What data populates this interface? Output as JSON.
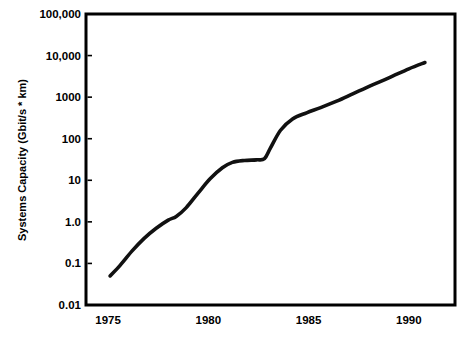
{
  "chart_data": {
    "type": "line",
    "title": "",
    "xlabel": "",
    "ylabel": "Systems Capacity (Gbit/s * km)",
    "xlim": [
      1973.9,
      1992.3
    ],
    "ylim": [
      0.01,
      100000
    ],
    "yscale": "log",
    "xscale": "linear",
    "grid": false,
    "legend": null,
    "x_ticks": [
      1975,
      1980,
      1985,
      1990
    ],
    "x_tick_labels": [
      "1975",
      "1980",
      "1985",
      "1990"
    ],
    "y_ticks": [
      0.01,
      0.1,
      1.0,
      10,
      100,
      1000,
      10000,
      100000
    ],
    "y_tick_labels": [
      "0.01",
      "0.1",
      "1.0",
      "10",
      "100",
      "1000",
      "10,000",
      "100,000"
    ],
    "series": [
      {
        "name": "Systems Capacity",
        "color": "#111111",
        "x": [
          1975.1,
          1975.6,
          1976.2,
          1976.8,
          1977.4,
          1978.0,
          1978.4,
          1978.9,
          1979.5,
          1980.1,
          1980.7,
          1981.2,
          1981.8,
          1982.4,
          1982.8,
          1983.1,
          1983.6,
          1984.2,
          1984.9,
          1985.6,
          1986.4,
          1987.2,
          1988.1,
          1989.0,
          1990.0,
          1990.8
        ],
        "y": [
          0.05,
          0.09,
          0.2,
          0.4,
          0.7,
          1.1,
          1.35,
          2.2,
          5.0,
          11.0,
          20.0,
          27.0,
          30.0,
          31.0,
          33.0,
          60.0,
          160.0,
          300.0,
          420.0,
          560.0,
          800.0,
          1200.0,
          1900.0,
          2900.0,
          4800.0,
          6800.0
        ]
      }
    ]
  },
  "axis": {
    "y_title": "Systems Capacity (Gbit/s * km)"
  }
}
